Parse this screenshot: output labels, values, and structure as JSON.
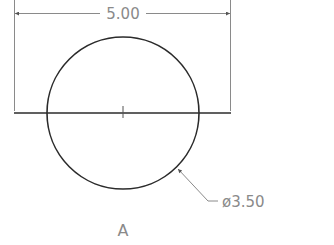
{
  "drawing": {
    "width_dimension": "5.00",
    "diameter_dimension": "ø3.50",
    "view_label": "A"
  },
  "colors": {
    "geometry": "#2b2b2b",
    "dimension": "#8a8a8a",
    "background": "#ffffff"
  }
}
